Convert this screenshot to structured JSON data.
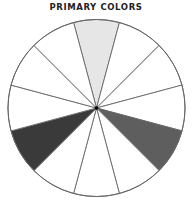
{
  "title": "PRIMARY COLORS",
  "wheel": {
    "center": [
      96.5,
      108
    ],
    "radius": 88.5,
    "segment_count": 12,
    "stroke_color": "#666666",
    "segments": [
      {
        "index": 0,
        "label": "primary-1",
        "fill": "#e6e6e6"
      },
      {
        "index": 1,
        "label": "",
        "fill": "#ffffff"
      },
      {
        "index": 2,
        "label": "",
        "fill": "#ffffff"
      },
      {
        "index": 3,
        "label": "",
        "fill": "#ffffff"
      },
      {
        "index": 4,
        "label": "primary-2",
        "fill": "#5e5e5e"
      },
      {
        "index": 5,
        "label": "",
        "fill": "#ffffff"
      },
      {
        "index": 6,
        "label": "",
        "fill": "#ffffff"
      },
      {
        "index": 7,
        "label": "",
        "fill": "#ffffff"
      },
      {
        "index": 8,
        "label": "primary-3",
        "fill": "#3a3a3a"
      },
      {
        "index": 9,
        "label": "",
        "fill": "#ffffff"
      },
      {
        "index": 10,
        "label": "",
        "fill": "#ffffff"
      },
      {
        "index": 11,
        "label": "",
        "fill": "#ffffff"
      }
    ]
  }
}
